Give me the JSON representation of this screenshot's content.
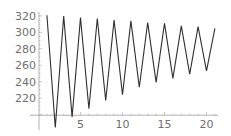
{
  "chart_data": {
    "type": "line",
    "title": "",
    "xlabel": "",
    "ylabel": "",
    "x": [
      1,
      2,
      3,
      4,
      5,
      6,
      7,
      8,
      9,
      10,
      11,
      12,
      13,
      14,
      15,
      16,
      17,
      18,
      19,
      20,
      21
    ],
    "series": [
      {
        "name": "series",
        "values": [
          321,
          184,
          320,
          197,
          318,
          207,
          317,
          217,
          315,
          224,
          314,
          233,
          312,
          239,
          311,
          244,
          308,
          249,
          307,
          253,
          305
        ]
      }
    ],
    "x_ticks": [
      "5",
      "10",
      "15",
      "20"
    ],
    "x_tick_values": [
      5,
      10,
      15,
      20
    ],
    "y_ticks": [
      "220",
      "240",
      "260",
      "280",
      "300",
      "320"
    ],
    "y_tick_values": [
      220,
      240,
      260,
      280,
      300,
      320
    ],
    "axis_origin": {
      "x": 0,
      "y": 199
    },
    "grid": false,
    "legend": "none",
    "line_color": "#303030",
    "axis_color": "#a0a0a0"
  }
}
